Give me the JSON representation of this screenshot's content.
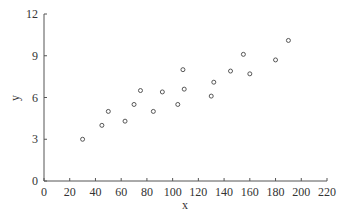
{
  "chart_data": {
    "type": "scatter",
    "title": "",
    "xlabel": "x",
    "ylabel": "y",
    "xlim": [
      0,
      220
    ],
    "ylim": [
      0,
      12
    ],
    "x_ticks": [
      0,
      20,
      40,
      60,
      80,
      100,
      120,
      140,
      160,
      180,
      200,
      220
    ],
    "y_ticks": [
      0,
      3,
      6,
      9,
      12
    ],
    "grid": false,
    "legend": null,
    "marker": "open-circle",
    "series": [
      {
        "name": "data",
        "points": [
          {
            "x": 30,
            "y": 3.0
          },
          {
            "x": 45,
            "y": 4.0
          },
          {
            "x": 50,
            "y": 5.0
          },
          {
            "x": 63,
            "y": 4.3
          },
          {
            "x": 70,
            "y": 5.5
          },
          {
            "x": 75,
            "y": 6.5
          },
          {
            "x": 85,
            "y": 5.0
          },
          {
            "x": 92,
            "y": 6.4
          },
          {
            "x": 104,
            "y": 5.5
          },
          {
            "x": 108,
            "y": 8.0
          },
          {
            "x": 109,
            "y": 6.6
          },
          {
            "x": 130,
            "y": 6.1
          },
          {
            "x": 132,
            "y": 7.1
          },
          {
            "x": 145,
            "y": 7.9
          },
          {
            "x": 155,
            "y": 9.1
          },
          {
            "x": 160,
            "y": 7.7
          },
          {
            "x": 180,
            "y": 8.7
          },
          {
            "x": 190,
            "y": 10.1
          }
        ]
      }
    ]
  },
  "colors": {
    "axis": "#555555",
    "marker": "#444444",
    "text": "#333333"
  }
}
